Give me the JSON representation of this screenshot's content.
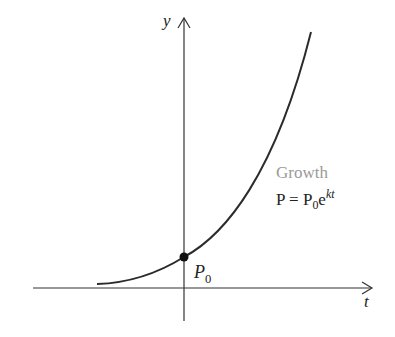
{
  "diagram": {
    "axes": {
      "x_label": "t",
      "y_label": "y"
    },
    "curve": {
      "name": "Growth",
      "formula": {
        "lhs": "P",
        "eq": "=",
        "coef": "P",
        "coef_sub": "0",
        "base": "e",
        "exponent": "kt"
      }
    },
    "point": {
      "label": "P",
      "label_sub": "0"
    },
    "colors": {
      "axis": "#333333",
      "curve": "#2b2b2b",
      "point": "#111111",
      "growth_label": "#9a9a9a",
      "text": "#222222"
    }
  }
}
